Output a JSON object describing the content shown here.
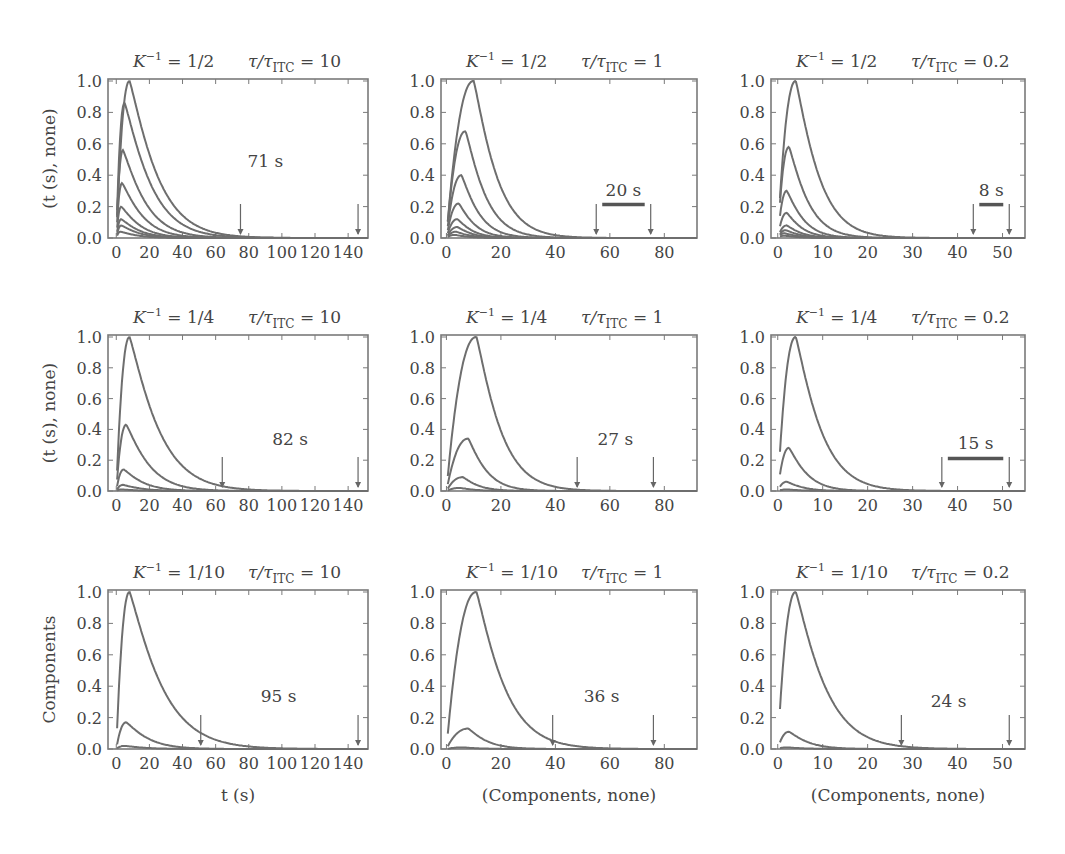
{
  "figure": {
    "ylabels_row": [
      "(t (s), none)",
      "(t (s), none)",
      "Components"
    ],
    "xlabels_col": [
      "t (s)",
      "(Components, none)",
      "(Components, none)"
    ],
    "ytick_labels": [
      "0.0",
      "0.2",
      "0.4",
      "0.6",
      "0.8",
      "1.0"
    ],
    "line_color": "#6e6e6e",
    "frame_color": "#7a7a7a"
  },
  "chart_data": [
    {
      "type": "line",
      "row": 0,
      "col": 0,
      "k_label": "1/2",
      "tau_label": "10",
      "xlim": [
        -5,
        152
      ],
      "xticks": [
        0,
        20,
        40,
        60,
        80,
        100,
        120,
        140
      ],
      "ylim": [
        0,
        1.0
      ],
      "series": [
        {
          "name": "c1",
          "peak": 1.0,
          "tpeak": 8
        },
        {
          "name": "c2",
          "peak": 0.86,
          "tpeak": 5
        },
        {
          "name": "c3",
          "peak": 0.56,
          "tpeak": 4
        },
        {
          "name": "c4",
          "peak": 0.35,
          "tpeak": 3.5
        },
        {
          "name": "c5",
          "peak": 0.2,
          "tpeak": 3
        },
        {
          "name": "c6",
          "peak": 0.12,
          "tpeak": 3
        },
        {
          "name": "c7",
          "peak": 0.08,
          "tpeak": 3
        },
        {
          "name": "c8",
          "peak": 0.04,
          "tpeak": 2.5
        }
      ],
      "decay": 18,
      "arrows": [
        75,
        146
      ],
      "annotation": "71 s",
      "annotation_x": 90,
      "annotation_y": 0.45,
      "bar": false
    },
    {
      "type": "line",
      "row": 0,
      "col": 1,
      "k_label": "1/2",
      "tau_label": "1",
      "xlim": [
        -2,
        92
      ],
      "xticks": [
        0,
        20,
        40,
        60,
        80
      ],
      "ylim": [
        0,
        1.0
      ],
      "series": [
        {
          "name": "c1",
          "peak": 1.0,
          "tpeak": 10
        },
        {
          "name": "c2",
          "peak": 0.68,
          "tpeak": 7
        },
        {
          "name": "c3",
          "peak": 0.4,
          "tpeak": 5.5
        },
        {
          "name": "c4",
          "peak": 0.22,
          "tpeak": 4.5
        },
        {
          "name": "c5",
          "peak": 0.12,
          "tpeak": 4
        },
        {
          "name": "c6",
          "peak": 0.07,
          "tpeak": 4
        },
        {
          "name": "c7",
          "peak": 0.04,
          "tpeak": 3.5
        },
        {
          "name": "c8",
          "peak": 0.02,
          "tpeak": 3
        }
      ],
      "decay": 9,
      "arrows": [
        55,
        75
      ],
      "annotation": "20 s",
      "annotation_x": 65,
      "annotation_y": 0.27,
      "bar": true
    },
    {
      "type": "line",
      "row": 0,
      "col": 2,
      "k_label": "1/2",
      "tau_label": "0.2",
      "xlim": [
        -1.5,
        55
      ],
      "xticks": [
        0,
        10,
        20,
        30,
        40,
        50
      ],
      "ylim": [
        0,
        1.0
      ],
      "series": [
        {
          "name": "c1",
          "peak": 1.0,
          "tpeak": 4
        },
        {
          "name": "c2",
          "peak": 0.58,
          "tpeak": 2.5
        },
        {
          "name": "c3",
          "peak": 0.3,
          "tpeak": 2
        },
        {
          "name": "c4",
          "peak": 0.16,
          "tpeak": 2
        },
        {
          "name": "c5",
          "peak": 0.08,
          "tpeak": 2
        },
        {
          "name": "c6",
          "peak": 0.05,
          "tpeak": 1.8
        },
        {
          "name": "c7",
          "peak": 0.03,
          "tpeak": 1.5
        },
        {
          "name": "c8",
          "peak": 0.015,
          "tpeak": 1.5
        }
      ],
      "decay": 5.5,
      "arrows": [
        43.5,
        51.5
      ],
      "annotation": "8 s",
      "annotation_x": 47.5,
      "annotation_y": 0.27,
      "bar": true
    },
    {
      "type": "line",
      "row": 1,
      "col": 0,
      "k_label": "1/4",
      "tau_label": "10",
      "xlim": [
        -5,
        152
      ],
      "xticks": [
        0,
        20,
        40,
        60,
        80,
        100,
        120,
        140
      ],
      "ylim": [
        0,
        1.0
      ],
      "series": [
        {
          "name": "c1",
          "peak": 1.0,
          "tpeak": 8
        },
        {
          "name": "c2",
          "peak": 0.43,
          "tpeak": 6
        },
        {
          "name": "c3",
          "peak": 0.14,
          "tpeak": 4.5
        },
        {
          "name": "c4",
          "peak": 0.04,
          "tpeak": 4
        },
        {
          "name": "c5",
          "peak": 0.01,
          "tpeak": 3
        }
      ],
      "decay": 19,
      "arrows": [
        64,
        146
      ],
      "annotation": "82 s",
      "annotation_x": 105,
      "annotation_y": 0.3,
      "bar": false
    },
    {
      "type": "line",
      "row": 1,
      "col": 1,
      "k_label": "1/4",
      "tau_label": "1",
      "xlim": [
        -2,
        92
      ],
      "xticks": [
        0,
        20,
        40,
        60,
        80
      ],
      "ylim": [
        0,
        1.0
      ],
      "series": [
        {
          "name": "c1",
          "peak": 1.0,
          "tpeak": 11
        },
        {
          "name": "c2",
          "peak": 0.34,
          "tpeak": 8
        },
        {
          "name": "c3",
          "peak": 0.09,
          "tpeak": 6
        },
        {
          "name": "c4",
          "peak": 0.02,
          "tpeak": 5
        }
      ],
      "decay": 9.5,
      "arrows": [
        48,
        76
      ],
      "annotation": "27 s",
      "annotation_x": 62,
      "annotation_y": 0.3,
      "bar": false
    },
    {
      "type": "line",
      "row": 1,
      "col": 2,
      "k_label": "1/4",
      "tau_label": "0.2",
      "xlim": [
        -1.5,
        55
      ],
      "xticks": [
        0,
        10,
        20,
        30,
        40,
        50
      ],
      "ylim": [
        0,
        1.0
      ],
      "series": [
        {
          "name": "c1",
          "peak": 1.0,
          "tpeak": 4
        },
        {
          "name": "c2",
          "peak": 0.28,
          "tpeak": 2.5
        },
        {
          "name": "c3",
          "peak": 0.06,
          "tpeak": 2
        },
        {
          "name": "c4",
          "peak": 0.01,
          "tpeak": 2
        }
      ],
      "decay": 6,
      "arrows": [
        36.5,
        51.5
      ],
      "annotation": "15 s",
      "annotation_x": 44,
      "annotation_y": 0.27,
      "bar": true
    },
    {
      "type": "line",
      "row": 2,
      "col": 0,
      "k_label": "1/10",
      "tau_label": "10",
      "xlim": [
        -5,
        152
      ],
      "xticks": [
        0,
        20,
        40,
        60,
        80,
        100,
        120,
        140
      ],
      "ylim": [
        0,
        1.0
      ],
      "series": [
        {
          "name": "c1",
          "peak": 1.0,
          "tpeak": 8
        },
        {
          "name": "c2",
          "peak": 0.17,
          "tpeak": 6
        },
        {
          "name": "c3",
          "peak": 0.02,
          "tpeak": 5
        }
      ],
      "decay": 21,
      "arrows": [
        51,
        146
      ],
      "annotation": "95 s",
      "annotation_x": 98,
      "annotation_y": 0.3,
      "bar": false
    },
    {
      "type": "line",
      "row": 2,
      "col": 1,
      "k_label": "1/10",
      "tau_label": "1",
      "xlim": [
        -2,
        92
      ],
      "xticks": [
        0,
        20,
        40,
        60,
        80
      ],
      "ylim": [
        0,
        1.0
      ],
      "series": [
        {
          "name": "c1",
          "peak": 1.0,
          "tpeak": 11
        },
        {
          "name": "c2",
          "peak": 0.13,
          "tpeak": 8
        },
        {
          "name": "c3",
          "peak": 0.01,
          "tpeak": 6
        }
      ],
      "decay": 11,
      "arrows": [
        39,
        76
      ],
      "annotation": "36 s",
      "annotation_x": 57,
      "annotation_y": 0.3,
      "bar": false
    },
    {
      "type": "line",
      "row": 2,
      "col": 2,
      "k_label": "1/10",
      "tau_label": "0.2",
      "xlim": [
        -1.5,
        55
      ],
      "xticks": [
        0,
        10,
        20,
        30,
        40,
        50
      ],
      "ylim": [
        0,
        1.0
      ],
      "series": [
        {
          "name": "c1",
          "peak": 1.0,
          "tpeak": 4
        },
        {
          "name": "c2",
          "peak": 0.11,
          "tpeak": 2.5
        },
        {
          "name": "c3",
          "peak": 0.01,
          "tpeak": 2
        }
      ],
      "decay": 7,
      "arrows": [
        27.5,
        51.5
      ],
      "annotation": "24 s",
      "annotation_x": 38,
      "annotation_y": 0.27,
      "bar": false
    }
  ]
}
